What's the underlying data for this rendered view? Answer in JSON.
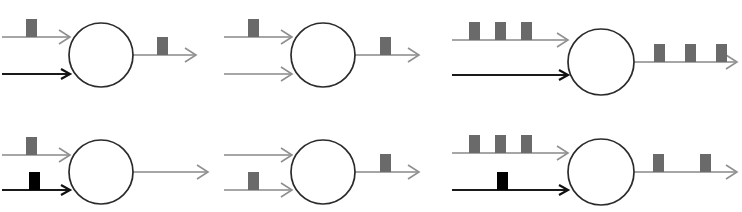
{
  "figure": {
    "title": "",
    "canvas": {
      "width": 742,
      "height": 212,
      "background": "#ffffff"
    },
    "colors": {
      "gray_line": "#888888",
      "dark_line": "#1a1a1a",
      "gray_pulse": "#6a6a6a",
      "black_pulse": "#000000",
      "neuron_outline": "#2b2b2b",
      "neuron_fill": "#ffffff"
    },
    "layout": {
      "rows": 2,
      "columns": 3,
      "panel_count": 6
    },
    "panels": [
      {
        "id": "panel-1",
        "position": "top-left",
        "neuron": {
          "cx": 101,
          "cy": 55,
          "r": 32
        },
        "inputs": [
          {
            "id": "input-top",
            "style": "gray",
            "x1": 2,
            "x2": 70,
            "y": 37,
            "pulses": [
              {
                "x": 26,
                "width": 11,
                "height": 18,
                "color": "gray"
              }
            ]
          },
          {
            "id": "input-bottom",
            "style": "dark",
            "x1": 2,
            "x2": 70,
            "y": 74,
            "pulses": []
          }
        ],
        "output": {
          "id": "output",
          "style": "gray",
          "x1": 133,
          "x2": 196,
          "y": 55,
          "pulses": [
            {
              "x": 157,
              "width": 11,
              "height": 18,
              "color": "gray"
            }
          ]
        }
      },
      {
        "id": "panel-2",
        "position": "top-center",
        "neuron": {
          "cx": 323,
          "cy": 55,
          "r": 32
        },
        "inputs": [
          {
            "id": "input-top",
            "style": "gray",
            "x1": 224,
            "x2": 292,
            "y": 37,
            "pulses": [
              {
                "x": 248,
                "width": 11,
                "height": 18,
                "color": "gray"
              }
            ]
          },
          {
            "id": "input-bottom",
            "style": "gray",
            "x1": 224,
            "x2": 292,
            "y": 74,
            "pulses": []
          }
        ],
        "output": {
          "id": "output",
          "style": "gray",
          "x1": 355,
          "x2": 419,
          "y": 55,
          "pulses": [
            {
              "x": 380,
              "width": 11,
              "height": 18,
              "color": "gray"
            }
          ]
        }
      },
      {
        "id": "panel-3",
        "position": "top-right",
        "neuron": {
          "cx": 601,
          "cy": 62,
          "r": 33
        },
        "inputs": [
          {
            "id": "input-top",
            "style": "gray",
            "x1": 452,
            "x2": 568,
            "y": 40,
            "pulses": [
              {
                "x": 469,
                "width": 11,
                "height": 18,
                "color": "gray"
              },
              {
                "x": 495,
                "width": 11,
                "height": 18,
                "color": "gray"
              },
              {
                "x": 521,
                "width": 11,
                "height": 18,
                "color": "gray"
              }
            ]
          },
          {
            "id": "input-bottom",
            "style": "dark",
            "x1": 452,
            "x2": 568,
            "y": 75,
            "pulses": []
          }
        ],
        "output": {
          "id": "output",
          "style": "gray",
          "x1": 634,
          "x2": 737,
          "y": 62,
          "pulses": [
            {
              "x": 654,
              "width": 11,
              "height": 18,
              "color": "gray"
            },
            {
              "x": 685,
              "width": 11,
              "height": 18,
              "color": "gray"
            },
            {
              "x": 716,
              "width": 11,
              "height": 18,
              "color": "gray"
            }
          ]
        }
      },
      {
        "id": "panel-4",
        "position": "bottom-left",
        "neuron": {
          "cx": 101,
          "cy": 172,
          "r": 32
        },
        "inputs": [
          {
            "id": "input-top",
            "style": "gray",
            "x1": 2,
            "x2": 70,
            "y": 155,
            "pulses": [
              {
                "x": 26,
                "width": 11,
                "height": 18,
                "color": "gray"
              }
            ]
          },
          {
            "id": "input-bottom",
            "style": "dark",
            "x1": 2,
            "x2": 70,
            "y": 190,
            "pulses": [
              {
                "x": 29,
                "width": 11,
                "height": 18,
                "color": "black"
              }
            ]
          }
        ],
        "output": {
          "id": "output",
          "style": "gray",
          "x1": 133,
          "x2": 208,
          "y": 172,
          "pulses": []
        }
      },
      {
        "id": "panel-5",
        "position": "bottom-center",
        "neuron": {
          "cx": 323,
          "cy": 172,
          "r": 32
        },
        "inputs": [
          {
            "id": "input-top",
            "style": "gray",
            "x1": 224,
            "x2": 292,
            "y": 155,
            "pulses": []
          },
          {
            "id": "input-bottom",
            "style": "gray",
            "x1": 224,
            "x2": 292,
            "y": 190,
            "pulses": [
              {
                "x": 248,
                "width": 11,
                "height": 18,
                "color": "gray"
              }
            ]
          }
        ],
        "output": {
          "id": "output",
          "style": "gray",
          "x1": 355,
          "x2": 419,
          "y": 172,
          "pulses": [
            {
              "x": 380,
              "width": 11,
              "height": 18,
              "color": "gray"
            }
          ]
        }
      },
      {
        "id": "panel-6",
        "position": "bottom-right",
        "neuron": {
          "cx": 601,
          "cy": 172,
          "r": 33
        },
        "inputs": [
          {
            "id": "input-top",
            "style": "gray",
            "x1": 452,
            "x2": 568,
            "y": 153,
            "pulses": [
              {
                "x": 469,
                "width": 11,
                "height": 18,
                "color": "gray"
              },
              {
                "x": 495,
                "width": 11,
                "height": 18,
                "color": "gray"
              },
              {
                "x": 521,
                "width": 11,
                "height": 18,
                "color": "gray"
              }
            ]
          },
          {
            "id": "input-bottom",
            "style": "dark",
            "x1": 452,
            "x2": 568,
            "y": 190,
            "pulses": [
              {
                "x": 497,
                "width": 11,
                "height": 18,
                "color": "black"
              }
            ]
          }
        ],
        "output": {
          "id": "output",
          "style": "gray",
          "x1": 634,
          "x2": 737,
          "y": 172,
          "pulses": [
            {
              "x": 653,
              "width": 11,
              "height": 18,
              "color": "gray"
            },
            {
              "x": 700,
              "width": 11,
              "height": 18,
              "color": "gray"
            }
          ]
        }
      }
    ]
  }
}
